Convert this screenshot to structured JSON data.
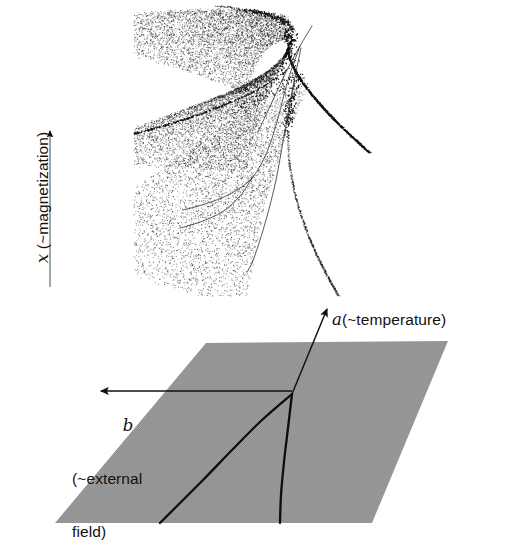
{
  "figure": {
    "kind": "cusp-catastrophe-diagram",
    "background_color": "#ffffff",
    "ink_color": "#111111",
    "plane_fill_color": "#9a9a9a"
  },
  "labels": {
    "x_axis_symbol": "x",
    "x_axis_text": " (~magnetization)",
    "a_axis_symbol": "a",
    "a_axis_text": "(~temperature)",
    "b_axis_symbol": "b",
    "b_axis_text_line1": "(~external",
    "b_axis_text_line2": "field)"
  },
  "chart_data": {
    "type": "scatter",
    "title": "",
    "xlabel": "b (~external field)",
    "ylabel": "x (~magnetization)",
    "zlabel": "a (~temperature)",
    "upper_panel": {
      "type": "scatter",
      "name": "equilibrium-surface-point-cloud",
      "n_points": 5200,
      "point_color": "#111111",
      "point_radius_px": 0.55,
      "bounds_px": {
        "x": 140,
        "y": 12,
        "width": 235,
        "height": 278
      },
      "fold_curves": [
        {
          "name": "upper-fold-line",
          "points_px": [
            [
              312,
              26
            ],
            [
              300,
              46
            ],
            [
              287,
              70
            ],
            [
              273,
              100
            ],
            [
              258,
              132
            ]
          ]
        },
        {
          "name": "lower-fold-line",
          "points_px": [
            [
              300,
              46
            ],
            [
              288,
              80
            ],
            [
              278,
              118
            ],
            [
              267,
              152
            ],
            [
              252,
              178
            ],
            [
              230,
              194
            ],
            [
              205,
              204
            ],
            [
              183,
              210
            ]
          ]
        },
        {
          "name": "cusp-edge-line",
          "points_px": [
            [
              301,
              48
            ],
            [
              292,
              92
            ],
            [
              284,
              136
            ],
            [
              276,
              180
            ],
            [
              266,
              220
            ],
            [
              254,
              258
            ],
            [
              247,
              272
            ]
          ]
        },
        {
          "name": "fold-tail-line",
          "points_px": [
            [
              252,
              178
            ],
            [
              240,
              196
            ],
            [
              222,
              212
            ],
            [
              200,
              222
            ],
            [
              180,
              228
            ]
          ]
        }
      ]
    },
    "lower_panel": {
      "type": "diagram",
      "name": "control-plane-with-bifurcation-set",
      "plane_polygon_px": [
        [
          206,
          343
        ],
        [
          448,
          341
        ],
        [
          372,
          523
        ],
        [
          55,
          523
        ]
      ],
      "plane_fill": "#9a9a9a",
      "cusp_point_px": [
        292,
        394
      ],
      "bifurcation_branches": [
        {
          "name": "left-fold-curve",
          "points_px": [
            [
              292,
              394
            ],
            [
              262,
              420
            ],
            [
              232,
              450
            ],
            [
              203,
              480
            ],
            [
              175,
              508
            ],
            [
              160,
              523
            ]
          ]
        },
        {
          "name": "right-fold-curve",
          "points_px": [
            [
              292,
              394
            ],
            [
              288,
              428
            ],
            [
              284,
              462
            ],
            [
              281,
              495
            ],
            [
              280,
              523
            ]
          ]
        }
      ],
      "axes": [
        {
          "name": "a-axis-arrow",
          "from_px": [
            292,
            394
          ],
          "to_px": [
            329,
            305
          ],
          "arrow": "end"
        },
        {
          "name": "b-axis-arrow",
          "from_px": [
            292,
            391
          ],
          "to_px": [
            97,
            391
          ],
          "arrow": "end"
        }
      ]
    },
    "vertical_axis": {
      "name": "x-axis-arrow",
      "from_px": [
        50,
        287
      ],
      "to_px": [
        50,
        127
      ],
      "arrow": "end"
    }
  }
}
